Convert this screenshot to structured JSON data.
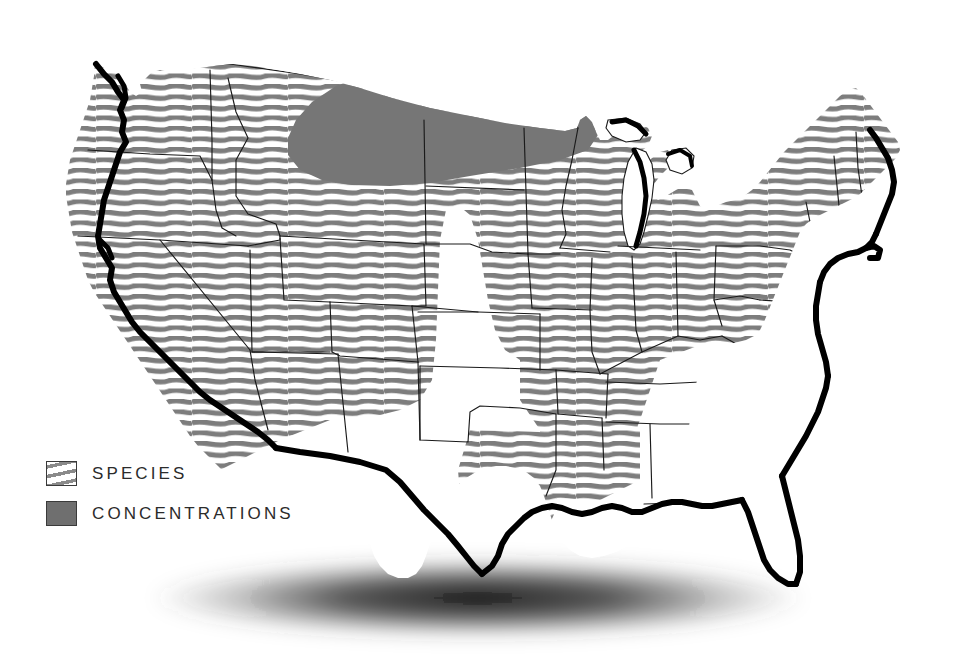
{
  "figure": {
    "background_color": "#ffffff",
    "width": 953,
    "height": 658
  },
  "legend": {
    "position": "lower-left",
    "items": [
      {
        "key": "species",
        "label": "SPECIES",
        "swatch_style": "hatched",
        "swatch_fill": "#ffffff",
        "swatch_pattern_color": "#8a8a8a",
        "swatch_border_color": "#3a3a3a"
      },
      {
        "key": "concentrations",
        "label": "CONCENTRATIONS",
        "swatch_style": "solid",
        "swatch_fill": "#6f6f6f",
        "swatch_border_color": "#3a3a3a"
      }
    ]
  },
  "map": {
    "region": "Contiguous United States",
    "colors": {
      "land_fill": "#ffffff",
      "state_border": "#1a1a1a",
      "coastline_heavy": "#000000",
      "hatch_stripe": "#7d7d7d",
      "concentration_fill": "#767676",
      "shadow": "#111111"
    },
    "hatch": {
      "description": "wavy horizontal stripes",
      "stripe_spacing_px": 10.5,
      "stripe_thickness_px": 5,
      "wave_amplitude_px": 4
    },
    "shadow_ellipse": {
      "center_x": 478,
      "center_y": 598,
      "radius_x": 330,
      "radius_y": 40
    },
    "species_region": {
      "description": "Hatched area covering the western, northern plains, midwestern and northeastern states, plus east Texas and the lower Mississippi valley",
      "states_shaded": [
        "Washington",
        "Oregon",
        "California",
        "Idaho",
        "Nevada",
        "Utah",
        "Arizona",
        "Montana",
        "Wyoming",
        "Colorado",
        "New Mexico",
        "North Dakota",
        "South Dakota",
        "Nebraska",
        "Kansas",
        "Minnesota",
        "Iowa",
        "Missouri",
        "Wisconsin",
        "Illinois",
        "Michigan",
        "Indiana",
        "Ohio",
        "Kentucky",
        "Tennessee",
        "West Virginia",
        "Pennsylvania",
        "New York",
        "Vermont",
        "New Hampshire",
        "Maine",
        "Massachusetts",
        "Rhode Island",
        "Connecticut",
        "New Jersey",
        "Delaware",
        "Maryland",
        "Arkansas",
        "Louisiana",
        "east Texas"
      ],
      "states_unshaded": [
        "Oklahoma",
        "central and west Texas",
        "Mississippi",
        "Alabama",
        "Georgia",
        "Florida",
        "South Carolina",
        "North Carolina",
        "Virginia"
      ]
    },
    "concentrations_region": {
      "description": "Solid grey area over eastern Montana, North Dakota, northern South Dakota and northern Minnesota, bounded to the south by an arc",
      "states": [
        "eastern Montana",
        "North Dakota",
        "northern South Dakota",
        "northern Minnesota"
      ]
    }
  }
}
